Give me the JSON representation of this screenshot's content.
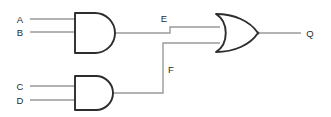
{
  "diagram": {
    "type": "logic-circuit",
    "canvas": {
      "width": 331,
      "height": 117
    },
    "colors": {
      "background": "#ffffff",
      "wire": "#9a9a9a",
      "gate_outline": "#2d2d2d",
      "gate_fill": "#ffffff",
      "text": "#2b2b2b"
    },
    "inputs": [
      {
        "id": "A",
        "label": "A",
        "label_x": 20,
        "label_y": 23,
        "wire_y": 19,
        "wire_x1": 30,
        "wire_x2": 74
      },
      {
        "id": "B",
        "label": "B",
        "label_x": 20,
        "label_y": 36,
        "wire_y": 32,
        "wire_x1": 30,
        "wire_x2": 74
      },
      {
        "id": "C",
        "label": "C",
        "label_x": 20,
        "label_y": 90,
        "wire_y": 86,
        "wire_x1": 30,
        "wire_x2": 74
      },
      {
        "id": "D",
        "label": "D",
        "label_x": 20,
        "label_y": 104,
        "wire_y": 100,
        "wire_x1": 30,
        "wire_x2": 74
      }
    ],
    "gates": [
      {
        "id": "AND1",
        "type": "AND",
        "label": "AND gate 1",
        "x": 74,
        "y": 12,
        "width": 40,
        "height": 41,
        "inputs": [
          "A",
          "B"
        ],
        "output": "E"
      },
      {
        "id": "AND2",
        "type": "AND",
        "label": "AND gate 2",
        "x": 74,
        "y": 76,
        "width": 40,
        "height": 34,
        "inputs": [
          "C",
          "D"
        ],
        "output": "F"
      },
      {
        "id": "OR1",
        "type": "OR",
        "label": "OR gate",
        "x": 215,
        "y": 14,
        "width": 44,
        "height": 38,
        "inputs": [
          "E",
          "F"
        ],
        "output": "Q"
      }
    ],
    "nets": [
      {
        "id": "E",
        "label": "E",
        "label_x": 164,
        "label_y": 22,
        "from": "AND1",
        "to": "OR1",
        "path": "M114,33 L219,26"
      },
      {
        "id": "F",
        "label": "F",
        "label_x": 170,
        "label_y": 72,
        "from": "AND2",
        "to": "OR1",
        "path": "M114,93 L163,93 L163,43 L219,43"
      },
      {
        "id": "Q",
        "label": "Q",
        "label_x": 307,
        "label_y": 37,
        "from": "OR1",
        "to": "output",
        "path": "M259,33 L300,33"
      }
    ],
    "outputs": [
      {
        "id": "Q",
        "label": "Q"
      }
    ],
    "expressions": {
      "E": "A AND B",
      "F": "C AND D",
      "Q": "E OR F"
    }
  }
}
